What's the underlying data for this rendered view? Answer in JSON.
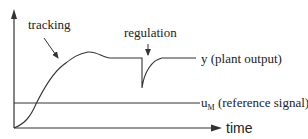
{
  "diagram": {
    "labels": {
      "tracking": "tracking",
      "regulation": "regulation",
      "plant_output": "y (plant output)",
      "reference_base": "u",
      "reference_sub": "M",
      "reference_text": " (reference signal)",
      "time_axis": "time"
    },
    "colors": {
      "line": "#333333",
      "text": "#222222",
      "background": "#ffffff"
    }
  }
}
